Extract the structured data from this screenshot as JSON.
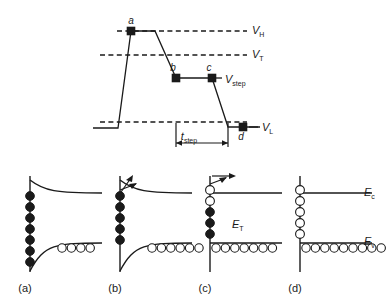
{
  "figure": {
    "top_panel": {
      "level_labels": [
        {
          "id": "VH",
          "base": "V",
          "sub": "H",
          "x": 252,
          "y": 34
        },
        {
          "id": "VT",
          "base": "V",
          "sub": "T",
          "x": 252,
          "y": 58
        },
        {
          "id": "Vstep",
          "base": "V",
          "sub": "step",
          "x": 225,
          "y": 83
        },
        {
          "id": "VL",
          "base": "V",
          "sub": "L",
          "x": 262,
          "y": 131
        }
      ],
      "point_labels": [
        {
          "id": "a",
          "text": "a",
          "x": 131,
          "y": 24
        },
        {
          "id": "b",
          "text": "b",
          "x": 173,
          "y": 71
        },
        {
          "id": "c",
          "text": "c",
          "x": 209,
          "y": 71
        },
        {
          "id": "d",
          "text": "d",
          "x": 241,
          "y": 140
        }
      ],
      "time_label": {
        "base": "t",
        "sub": "step",
        "x": 189,
        "y": 140
      }
    },
    "band_panels": [
      {
        "id": "a",
        "label": "(a)",
        "label_x": 25,
        "label_y": 292,
        "origin_x": 30,
        "bend": "strong",
        "conduction_carriers": [
          {
            "type": "filled",
            "count": 7
          }
        ],
        "valence_circles": 4,
        "valence_circle_type": "open",
        "arrow": false,
        "trap_label": null,
        "band_labels": []
      },
      {
        "id": "b",
        "label": "(b)",
        "label_x": 115,
        "label_y": 292,
        "origin_x": 120,
        "bend": "strong",
        "conduction_carriers": [
          {
            "type": "filled",
            "count": 5
          }
        ],
        "valence_circles": 6,
        "valence_circle_type": "open",
        "arrow": true,
        "trap_label": null,
        "band_labels": []
      },
      {
        "id": "c",
        "label": "(c)",
        "label_x": 205,
        "label_y": 292,
        "origin_x": 210,
        "bend": "flat",
        "conduction_carriers": [
          {
            "type": "open",
            "count": 2
          },
          {
            "type": "filled",
            "count": 3
          }
        ],
        "valence_circles": 7,
        "valence_circle_type": "open",
        "arrow": true,
        "trap_label": {
          "base": "E",
          "sub": "T",
          "x": 232,
          "y": 228
        },
        "band_labels": []
      },
      {
        "id": "d",
        "label": "(d)",
        "label_x": 295,
        "label_y": 292,
        "origin_x": 300,
        "bend": "flat",
        "conduction_carriers": [
          {
            "type": "open",
            "count": 5
          }
        ],
        "valence_circles": 9,
        "valence_circle_type": "open",
        "arrow": false,
        "trap_label": null,
        "band_labels": [
          {
            "base": "E",
            "sub": "c",
            "x": 364,
            "y": 196
          },
          {
            "base": "E",
            "sub": "v",
            "x": 364,
            "y": 245
          }
        ]
      }
    ]
  },
  "chart_data": {
    "type": "line",
    "xlabel": "",
    "ylabel": "",
    "grid": false,
    "legend": "none",
    "annotations": [
      "V_H",
      "V_T",
      "V_step",
      "V_L",
      "t_step",
      "a",
      "b",
      "c",
      "d"
    ],
    "reference_levels": [
      {
        "name": "V_H",
        "y_px": 31
      },
      {
        "name": "V_T",
        "y_px": 55
      },
      {
        "name": "V_L",
        "y_px": 122
      }
    ],
    "waveform_px": [
      {
        "x": 93,
        "y": 128
      },
      {
        "x": 118,
        "y": 128
      },
      {
        "x": 131,
        "y": 31
      },
      {
        "x": 155,
        "y": 31
      },
      {
        "x": 176,
        "y": 78
      },
      {
        "x": 212,
        "y": 78
      },
      {
        "x": 228,
        "y": 127
      },
      {
        "x": 260,
        "y": 127
      }
    ],
    "markers_px": [
      {
        "label": "a",
        "x": 131,
        "y": 31
      },
      {
        "label": "b",
        "x": 176,
        "y": 78
      },
      {
        "label": "c",
        "x": 212,
        "y": 78
      },
      {
        "label": "d",
        "x": 243,
        "y": 127
      }
    ],
    "t_step_span_px": {
      "x0": 176,
      "x1": 228,
      "y": 143
    }
  }
}
